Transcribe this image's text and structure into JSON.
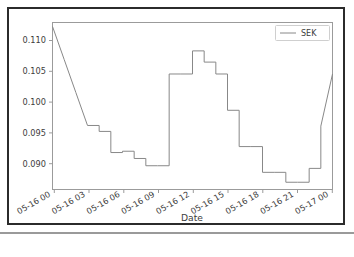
{
  "figure": {
    "background_color": "#ffffff",
    "frame_color": "#2b2b2b",
    "axes_color": "#9b9b9b"
  },
  "chart_data": {
    "type": "line",
    "title": "",
    "xlabel": "Date",
    "ylabel": "",
    "grid": false,
    "legend_position": "upper right",
    "line_color": "#888888",
    "drawstyle": "steps-post",
    "xlim": [
      "05-16 00:00",
      "05-17 00:00"
    ],
    "ylim": [
      0.0875,
      0.1128
    ],
    "xtick_labels": [
      "05-16 00",
      "05-16 03",
      "05-16 06",
      "05-16 09",
      "05-16 12",
      "05-16 15",
      "05-16 18",
      "05-16 21",
      "05-17 00"
    ],
    "ytick_labels": [
      "0.090",
      "0.095",
      "0.100",
      "0.105",
      "0.110"
    ],
    "ytick_values": [
      0.09,
      0.095,
      0.1,
      0.105,
      0.11
    ],
    "series": [
      {
        "name": "SEK",
        "x": [
          "05-16 00",
          "05-16 01",
          "05-16 02",
          "05-16 03",
          "05-16 04",
          "05-16 05",
          "05-16 06",
          "05-16 07",
          "05-16 08",
          "05-16 09",
          "05-16 10",
          "05-16 11",
          "05-16 12",
          "05-16 13",
          "05-16 14",
          "05-16 15",
          "05-16 16",
          "05-16 17",
          "05-16 18",
          "05-16 19",
          "05-16 20",
          "05-16 21",
          "05-16 22",
          "05-16 23",
          "05-17 00"
        ],
        "x_hours": [
          0,
          1,
          2,
          3,
          4,
          5,
          6,
          7,
          8,
          9,
          10,
          11,
          12,
          13,
          14,
          15,
          16,
          17,
          18,
          19,
          20,
          21,
          22,
          23,
          24
        ],
        "values": [
          0.1122,
          0.1072,
          0.1022,
          0.0972,
          0.0963,
          0.0931,
          0.0933,
          0.0922,
          0.0911,
          0.0911,
          0.105,
          0.105,
          0.1085,
          0.1068,
          0.105,
          0.0995,
          0.094,
          0.094,
          0.0901,
          0.0901,
          0.0886,
          0.0886,
          0.0907,
          0.0971,
          0.105
        ]
      }
    ],
    "legend_entries": [
      "SEK"
    ]
  }
}
